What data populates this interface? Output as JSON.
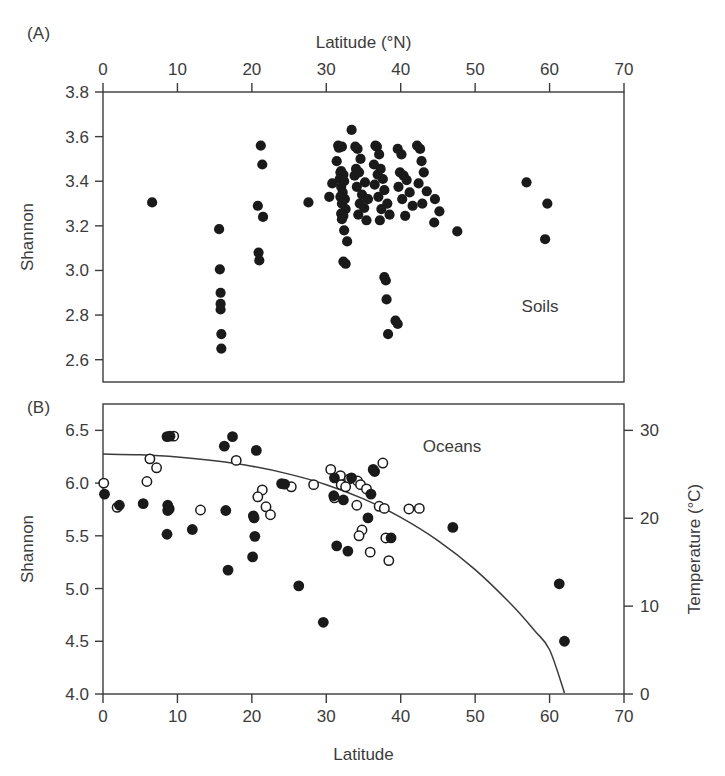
{
  "figure": {
    "panel_a_tag": "(A)",
    "panel_b_tag": "(B)"
  },
  "chart_data": [
    {
      "type": "scatter",
      "panel": "(A)",
      "title": "",
      "annotation": "Soils",
      "xlabel": "Latitude (°N)",
      "xlabel_position": "top",
      "ylabel": "Shannon",
      "xlim": [
        0,
        70
      ],
      "ylim": [
        2.5,
        3.8
      ],
      "xticks": [
        0,
        10,
        20,
        30,
        40,
        50,
        60,
        70
      ],
      "xticklabels": [
        "0",
        "10",
        "20",
        "30",
        "40",
        "50",
        "60",
        "70"
      ],
      "yticks": [
        2.6,
        2.8,
        3.0,
        3.2,
        3.4,
        3.6,
        3.8
      ],
      "yticklabels": [
        "2.6",
        "2.8",
        "3.0",
        "3.2",
        "3.4",
        "3.6",
        "3.8"
      ],
      "grid": false,
      "legend": "none",
      "marker": "filled-circle",
      "points": [
        [
          6.6,
          3.305
        ],
        [
          15.6,
          3.185
        ],
        [
          15.7,
          3.005
        ],
        [
          15.8,
          2.9
        ],
        [
          15.8,
          2.85
        ],
        [
          15.8,
          2.825
        ],
        [
          15.9,
          2.715
        ],
        [
          15.9,
          2.65
        ],
        [
          21.2,
          3.56
        ],
        [
          21.4,
          3.475
        ],
        [
          20.8,
          3.29
        ],
        [
          21.5,
          3.24
        ],
        [
          20.9,
          3.08
        ],
        [
          21.0,
          3.045
        ],
        [
          27.6,
          3.305
        ],
        [
          30.8,
          3.39
        ],
        [
          30.4,
          3.33
        ],
        [
          31.9,
          3.44
        ],
        [
          31.6,
          3.56
        ],
        [
          31.7,
          3.55
        ],
        [
          32.1,
          3.555
        ],
        [
          31.4,
          3.49
        ],
        [
          32.0,
          3.445
        ],
        [
          32.3,
          3.43
        ],
        [
          31.8,
          3.41
        ],
        [
          32.4,
          3.4
        ],
        [
          32.0,
          3.375
        ],
        [
          32.2,
          3.35
        ],
        [
          31.9,
          3.33
        ],
        [
          32.5,
          3.32
        ],
        [
          32.1,
          3.3
        ],
        [
          32.6,
          3.275
        ],
        [
          32.0,
          3.255
        ],
        [
          32.3,
          3.245
        ],
        [
          32.1,
          3.23
        ],
        [
          32.4,
          3.18
        ],
        [
          32.8,
          3.13
        ],
        [
          32.3,
          3.04
        ],
        [
          32.6,
          3.03
        ],
        [
          33.4,
          3.63
        ],
        [
          33.9,
          3.555
        ],
        [
          34.2,
          3.545
        ],
        [
          34.6,
          3.5
        ],
        [
          34.0,
          3.455
        ],
        [
          34.4,
          3.44
        ],
        [
          33.8,
          3.425
        ],
        [
          35.2,
          3.395
        ],
        [
          34.1,
          3.375
        ],
        [
          34.8,
          3.34
        ],
        [
          35.6,
          3.32
        ],
        [
          34.5,
          3.3
        ],
        [
          35.1,
          3.28
        ],
        [
          34.3,
          3.25
        ],
        [
          35.4,
          3.225
        ],
        [
          36.6,
          3.56
        ],
        [
          36.8,
          3.555
        ],
        [
          37.1,
          3.52
        ],
        [
          36.4,
          3.475
        ],
        [
          37.3,
          3.455
        ],
        [
          36.9,
          3.43
        ],
        [
          37.6,
          3.41
        ],
        [
          36.5,
          3.385
        ],
        [
          37.8,
          3.36
        ],
        [
          37.0,
          3.33
        ],
        [
          38.2,
          3.3
        ],
        [
          37.4,
          3.275
        ],
        [
          38.5,
          3.25
        ],
        [
          37.2,
          3.225
        ],
        [
          39.6,
          3.545
        ],
        [
          40.1,
          3.52
        ],
        [
          39.9,
          3.44
        ],
        [
          40.4,
          3.425
        ],
        [
          40.8,
          3.405
        ],
        [
          39.7,
          3.375
        ],
        [
          41.2,
          3.35
        ],
        [
          40.2,
          3.32
        ],
        [
          41.6,
          3.29
        ],
        [
          40.6,
          3.245
        ],
        [
          42.2,
          3.56
        ],
        [
          42.6,
          3.545
        ],
        [
          42.8,
          3.49
        ],
        [
          43.1,
          3.44
        ],
        [
          42.4,
          3.39
        ],
        [
          43.5,
          3.355
        ],
        [
          42.9,
          3.3
        ],
        [
          44.6,
          3.32
        ],
        [
          45.2,
          3.265
        ],
        [
          37.8,
          2.97
        ],
        [
          38.0,
          2.955
        ],
        [
          38.1,
          2.87
        ],
        [
          38.3,
          2.715
        ],
        [
          39.3,
          2.775
        ],
        [
          39.6,
          2.76
        ],
        [
          47.6,
          3.175
        ],
        [
          44.5,
          3.215
        ],
        [
          56.9,
          3.395
        ],
        [
          59.7,
          3.3
        ],
        [
          59.4,
          3.14
        ]
      ]
    },
    {
      "type": "scatter",
      "panel": "(B)",
      "title": "",
      "annotation": "Oceans",
      "xlabel": "Latitude",
      "xlabel_position": "bottom",
      "ylabel": "Shannon",
      "ylabel_right": "Temperature (°C)",
      "xlim": [
        0,
        70
      ],
      "ylim": [
        4.0,
        6.75
      ],
      "ylim_right": [
        0,
        33
      ],
      "xticks": [
        0,
        10,
        20,
        30,
        40,
        50,
        60,
        70
      ],
      "xticklabels": [
        "0",
        "10",
        "20",
        "30",
        "40",
        "50",
        "60",
        "70"
      ],
      "yticks": [
        4.0,
        4.5,
        5.0,
        5.5,
        6.0,
        6.5
      ],
      "yticklabels": [
        "4.0",
        "4.5",
        "5.0",
        "5.5",
        "6.0",
        "6.5"
      ],
      "yticks_right": [
        0,
        10,
        20,
        30
      ],
      "yticklabels_right": [
        "0",
        "10",
        "20",
        "30"
      ],
      "grid": false,
      "legend": "none",
      "series": [
        {
          "name": "Shannon (filled circles)",
          "marker": "filled-circle",
          "points": [
            [
              0.2,
              5.895
            ],
            [
              2.2,
              5.79
            ],
            [
              5.4,
              5.805
            ],
            [
              8.6,
              6.44
            ],
            [
              9.0,
              6.445
            ],
            [
              8.7,
              5.79
            ],
            [
              8.9,
              5.755
            ],
            [
              8.7,
              5.74
            ],
            [
              8.6,
              5.515
            ],
            [
              12.0,
              5.56
            ],
            [
              16.3,
              6.35
            ],
            [
              17.4,
              6.44
            ],
            [
              16.5,
              5.74
            ],
            [
              16.8,
              5.175
            ],
            [
              20.6,
              6.31
            ],
            [
              20.2,
              5.69
            ],
            [
              20.3,
              5.67
            ],
            [
              20.4,
              5.495
            ],
            [
              20.1,
              5.3
            ],
            [
              24.0,
              5.995
            ],
            [
              24.4,
              5.99
            ],
            [
              26.3,
              5.025
            ],
            [
              29.6,
              4.68
            ],
            [
              31.1,
              6.05
            ],
            [
              31.0,
              5.88
            ],
            [
              33.4,
              6.05
            ],
            [
              32.3,
              5.84
            ],
            [
              31.4,
              5.405
            ],
            [
              32.9,
              5.355
            ],
            [
              36.3,
              6.13
            ],
            [
              36.5,
              6.11
            ],
            [
              36.0,
              5.895
            ],
            [
              35.6,
              5.67
            ],
            [
              38.7,
              5.48
            ],
            [
              47.0,
              5.58
            ],
            [
              61.3,
              5.045
            ],
            [
              62.0,
              4.5
            ]
          ]
        },
        {
          "name": "Temperature (open circles)",
          "marker": "open-circle",
          "points": [
            [
              0.1,
              6.0
            ],
            [
              1.9,
              5.77
            ],
            [
              6.3,
              6.23
            ],
            [
              7.2,
              6.145
            ],
            [
              5.9,
              6.015
            ],
            [
              9.5,
              6.445
            ],
            [
              13.1,
              5.745
            ],
            [
              17.9,
              6.215
            ],
            [
              21.4,
              5.935
            ],
            [
              20.8,
              5.87
            ],
            [
              21.9,
              5.775
            ],
            [
              22.5,
              5.7
            ],
            [
              25.3,
              5.965
            ],
            [
              28.3,
              5.985
            ],
            [
              30.6,
              6.13
            ],
            [
              31.9,
              6.07
            ],
            [
              33.1,
              6.04
            ],
            [
              32.0,
              5.985
            ],
            [
              32.6,
              5.965
            ],
            [
              31.1,
              5.86
            ],
            [
              34.2,
              6.02
            ],
            [
              34.6,
              5.985
            ],
            [
              35.4,
              5.945
            ],
            [
              34.1,
              5.79
            ],
            [
              34.8,
              5.555
            ],
            [
              34.4,
              5.5
            ],
            [
              35.9,
              5.345
            ],
            [
              37.6,
              6.19
            ],
            [
              37.1,
              5.78
            ],
            [
              37.8,
              5.76
            ],
            [
              38.0,
              5.48
            ],
            [
              38.4,
              5.265
            ],
            [
              41.1,
              5.755
            ],
            [
              42.5,
              5.76
            ]
          ]
        },
        {
          "name": "Fitted temperature curve",
          "marker": "line",
          "note": "Quadratic decline from ~27.5°C near equator to 0°C at latitude ~62",
          "points": [
            [
              0,
              6.275
            ],
            [
              5,
              6.268
            ],
            [
              10,
              6.248
            ],
            [
              15,
              6.212
            ],
            [
              20,
              6.16
            ],
            [
              25,
              6.085
            ],
            [
              30,
              5.985
            ],
            [
              35,
              5.85
            ],
            [
              40,
              5.675
            ],
            [
              45,
              5.455
            ],
            [
              50,
              5.18
            ],
            [
              55,
              4.84
            ],
            [
              58,
              4.6
            ],
            [
              60,
              4.42
            ],
            [
              62,
              4.01
            ]
          ]
        }
      ]
    }
  ]
}
